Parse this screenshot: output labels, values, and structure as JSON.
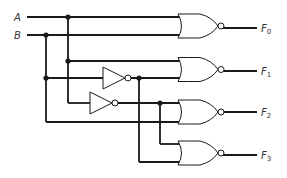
{
  "diagram": {
    "type": "logic-circuit",
    "inputs": [
      {
        "name": "A",
        "y": 17
      },
      {
        "name": "B",
        "y": 35
      }
    ],
    "outputs": [
      {
        "name": "F",
        "sub": "0",
        "y": 28
      },
      {
        "name": "F",
        "sub": "1",
        "y": 71
      },
      {
        "name": "F",
        "sub": "2",
        "y": 112
      },
      {
        "name": "F",
        "sub": "3",
        "y": 155
      }
    ],
    "gates": [
      {
        "id": "nor0",
        "type": "NOR",
        "inputs": [
          "A",
          "B"
        ],
        "output": "F0"
      },
      {
        "id": "nor1",
        "type": "NOR",
        "inputs": [
          "A",
          "B'"
        ],
        "output": "F1"
      },
      {
        "id": "nor2",
        "type": "NOR",
        "inputs": [
          "A'",
          "B"
        ],
        "output": "F2"
      },
      {
        "id": "nor3",
        "type": "NOR",
        "inputs": [
          "A'",
          "B'"
        ],
        "output": "F3"
      },
      {
        "id": "inv1",
        "type": "NOT",
        "input": "B",
        "output": "B'"
      },
      {
        "id": "inv2",
        "type": "NOT",
        "input": "A",
        "output": "A'"
      }
    ],
    "colors": {
      "wire": "#1a1a1a",
      "label": "#333333",
      "background": "#ffffff"
    }
  }
}
